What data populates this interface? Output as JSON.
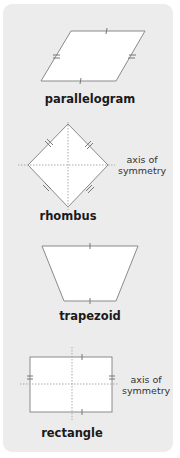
{
  "shapes": [
    {
      "name": "parallelogram",
      "label": "parallelogram"
    },
    {
      "name": "rhombus",
      "label": "rhombus",
      "annotation": "axis of symmetry"
    },
    {
      "name": "trapezoid",
      "label": "trapezoid"
    },
    {
      "name": "rectangle",
      "label": "rectangle",
      "annotation": "axis of symmetry"
    }
  ],
  "annotations": {
    "rhombus_line1": "axis of",
    "rhombus_line2": "symmetry",
    "rectangle_line1": "axis of",
    "rectangle_line2": "symmetry"
  },
  "colors": {
    "panel": "#ececec",
    "shape_fill": "#ffffff",
    "stroke": "#888888",
    "axis": "#999999"
  }
}
